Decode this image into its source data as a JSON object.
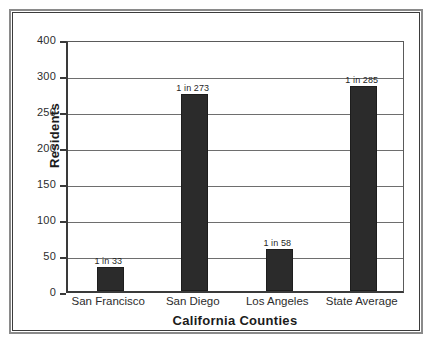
{
  "chart_data": {
    "type": "bar",
    "title": "",
    "xlabel": "California Counties",
    "ylabel": "Residents",
    "categories": [
      "San Francisco",
      "San Diego",
      "Los Angeles",
      "State Average"
    ],
    "values": [
      33,
      273,
      58,
      285
    ],
    "data_labels": [
      "1 in 33",
      "1 in 273",
      "1 in 58",
      "1 in 285"
    ],
    "ytick_labels": [
      "400",
      "300",
      "250",
      "200",
      "150",
      "100",
      "50",
      "0"
    ],
    "ytick_values": [
      400,
      300,
      250,
      200,
      150,
      100,
      50,
      0
    ],
    "ylim": [
      0,
      400
    ],
    "grid": true,
    "legend": false,
    "bar_color": "#2b2b2b",
    "plot_background": "#ffffff",
    "gridline_color": "#6e6e6e",
    "axis_color": "#3a3a3a",
    "note_axis_scale": "non-uniform: ticks evenly spaced but 300-400 spans 100 units while lower intervals span 50 units"
  }
}
